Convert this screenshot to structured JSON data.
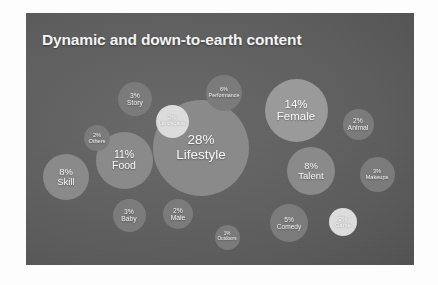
{
  "slide": {
    "title": "Dynamic and down-to-earth content",
    "background_color": "#5e5e5e",
    "title_color": "#f4f4f4",
    "page_background": "#ffffff"
  },
  "chart_data": {
    "type": "bubble",
    "title": "Dynamic and down-to-earth content",
    "xlabel": "",
    "ylabel": "",
    "unit": "%",
    "legend": "none",
    "grid": false,
    "categories": [
      "Lifestyle",
      "Female",
      "Food",
      "Skill",
      "Talent",
      "Performance",
      "Comedy",
      "Story",
      "Baby",
      "Makeups",
      "Landscape",
      "Others",
      "Male",
      "Animal",
      "Game",
      "Outdoors"
    ],
    "values": [
      28,
      14,
      11,
      8,
      8,
      6,
      5,
      3,
      3,
      3,
      3,
      2,
      2,
      2,
      2,
      1
    ],
    "bubbles": [
      {
        "label": "Lifestyle",
        "pct": "28%",
        "value": 28,
        "x": 201,
        "y": 148,
        "d": 96,
        "tone": "tone-light",
        "fs": 13.5
      },
      {
        "label": "Female",
        "pct": "14%",
        "value": 14,
        "x": 296,
        "y": 110,
        "d": 63,
        "tone": "tone-pale",
        "fs": 11.5
      },
      {
        "label": "Food",
        "pct": "11%",
        "value": 11,
        "x": 124,
        "y": 160,
        "d": 57,
        "tone": "tone-light",
        "fs": 10.5
      },
      {
        "label": "Skill",
        "pct": "8%",
        "value": 8,
        "x": 66,
        "y": 177,
        "d": 46,
        "tone": "tone-light",
        "fs": 9.5
      },
      {
        "label": "Talent",
        "pct": "8%",
        "value": 8,
        "x": 311,
        "y": 171,
        "d": 48,
        "tone": "tone-light",
        "fs": 9.5
      },
      {
        "label": "Performance",
        "pct": "6%",
        "value": 6,
        "x": 224,
        "y": 93,
        "d": 36,
        "tone": "tone-mid",
        "fs": 5.4
      },
      {
        "label": "Comedy",
        "pct": "5%",
        "value": 5,
        "x": 289,
        "y": 223,
        "d": 38,
        "tone": "tone-mid",
        "fs": 6.6
      },
      {
        "label": "Story",
        "pct": "3%",
        "value": 3,
        "x": 135,
        "y": 99,
        "d": 34,
        "tone": "tone-mid",
        "fs": 6.8
      },
      {
        "label": "Baby",
        "pct": "3%",
        "value": 3,
        "x": 129,
        "y": 215,
        "d": 33,
        "tone": "tone-mid",
        "fs": 6.8
      },
      {
        "label": "Makeups",
        "pct": "3%",
        "value": 3,
        "x": 377,
        "y": 174,
        "d": 35,
        "tone": "tone-mid",
        "fs": 5.6
      },
      {
        "label": "Landscape",
        "pct": "3%",
        "value": 3,
        "x": 172,
        "y": 121,
        "d": 33,
        "tone": "tone-white",
        "fs": 5.4
      },
      {
        "label": "Others",
        "pct": "2%",
        "value": 2,
        "x": 97,
        "y": 138,
        "d": 26,
        "tone": "tone-mid",
        "fs": 5.6
      },
      {
        "label": "Male",
        "pct": "2%",
        "value": 2,
        "x": 178,
        "y": 214,
        "d": 30,
        "tone": "tone-mid",
        "fs": 6.8
      },
      {
        "label": "Animal",
        "pct": "2%",
        "value": 2,
        "x": 358,
        "y": 124,
        "d": 31,
        "tone": "tone-mid",
        "fs": 6.8
      },
      {
        "label": "Game",
        "pct": "2%",
        "value": 2,
        "x": 343,
        "y": 222,
        "d": 28,
        "tone": "tone-white",
        "fs": 5.8
      },
      {
        "label": "Outdoors",
        "pct": "1%",
        "value": 1,
        "x": 227,
        "y": 237,
        "d": 25,
        "tone": "tone-mid",
        "fs": 4.6
      }
    ]
  }
}
